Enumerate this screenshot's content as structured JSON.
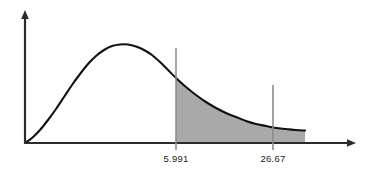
{
  "chart_data": {
    "type": "area",
    "title": "",
    "subtitle": "",
    "xlabel": "",
    "ylabel": "",
    "grid": false,
    "legend": null,
    "background_color": "#ffffff",
    "curve_color": "#111111",
    "shade_color": "#a9a9a9",
    "axis_color": "#2b2b2b",
    "marker_line_color": "#8c8c8c",
    "xlim": [
      0,
      40
    ],
    "ylim": [
      0,
      1
    ],
    "axis": {
      "x_arrow": true,
      "y_arrow": true,
      "origin_label": ""
    },
    "markers": [
      {
        "name": "critical-value",
        "label": "5.991",
        "x": 5.991,
        "curve_y": 0.63
      },
      {
        "name": "test-statistic",
        "label": "26.67",
        "x": 26.67,
        "curve_y": 0.16
      }
    ],
    "shaded_region": {
      "from_label": "5.991",
      "from_x": 5.991,
      "to_x": 40,
      "fill": "#a9a9a9"
    },
    "curve_points_px": [
      [
        25,
        143
      ],
      [
        32,
        138
      ],
      [
        40,
        130
      ],
      [
        48,
        120
      ],
      [
        56,
        109
      ],
      [
        64,
        97
      ],
      [
        72,
        85
      ],
      [
        80,
        74
      ],
      [
        88,
        64
      ],
      [
        96,
        56
      ],
      [
        104,
        50
      ],
      [
        112,
        46
      ],
      [
        120,
        44.5
      ],
      [
        128,
        44.5
      ],
      [
        136,
        46.5
      ],
      [
        144,
        50
      ],
      [
        152,
        55
      ],
      [
        160,
        62
      ],
      [
        168,
        70
      ],
      [
        176,
        78
      ],
      [
        186,
        87
      ],
      [
        196,
        95
      ],
      [
        206,
        102
      ],
      [
        216,
        108
      ],
      [
        226,
        113
      ],
      [
        236,
        117
      ],
      [
        246,
        121
      ],
      [
        256,
        124
      ],
      [
        266,
        126
      ],
      [
        276,
        128
      ],
      [
        286,
        129
      ],
      [
        296,
        130
      ],
      [
        305,
        130.5
      ]
    ],
    "geometry_px": {
      "origin": [
        25,
        143
      ],
      "y_axis_top": [
        25,
        11
      ],
      "x_axis_end": [
        355,
        143
      ],
      "marker1_x": 176,
      "marker1_top_y": 48,
      "marker1_bottom_y": 150,
      "marker2_x": 273,
      "marker2_top_y": 85,
      "marker2_bottom_y": 150,
      "shade_right_edge": 305,
      "label_baseline_y": 162
    }
  }
}
